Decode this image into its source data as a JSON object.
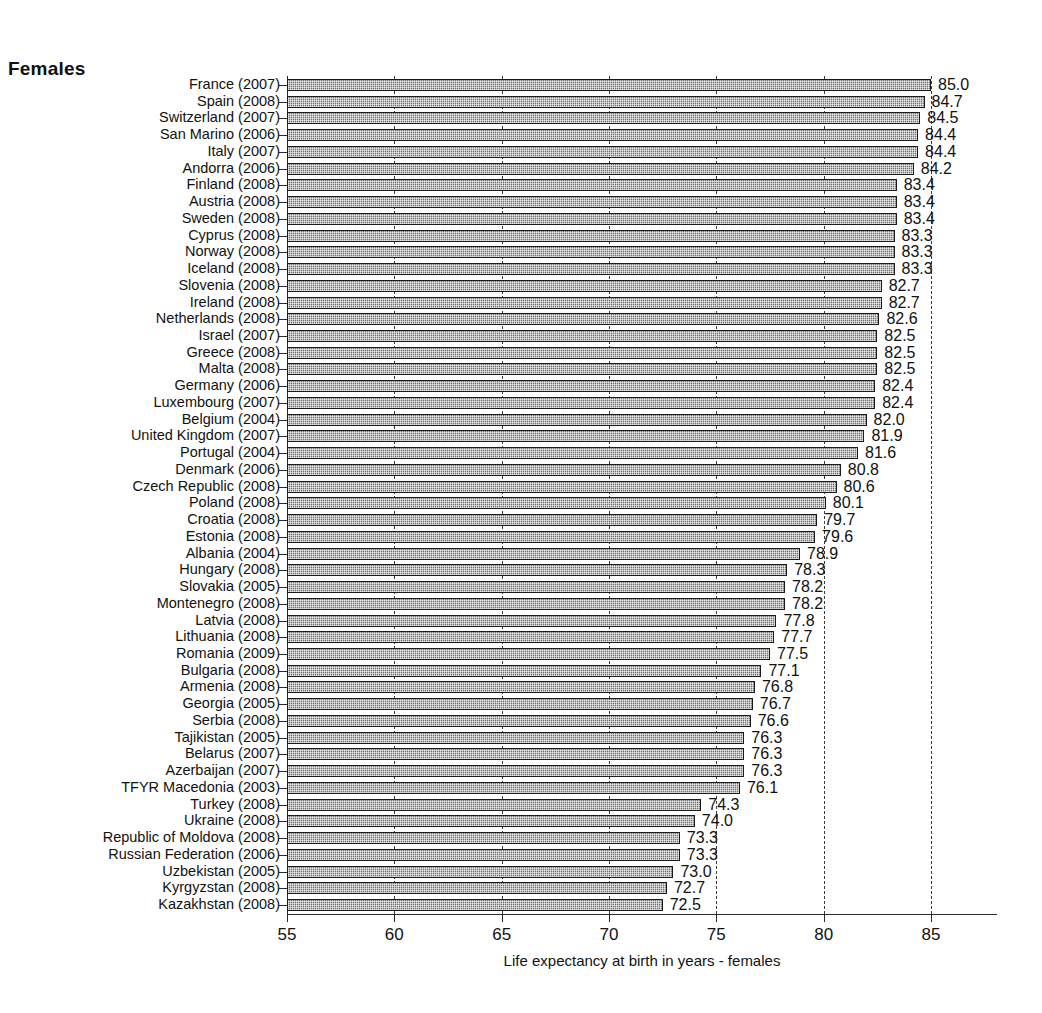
{
  "panel": {
    "title": "Females"
  },
  "chart_data": {
    "type": "bar",
    "orientation": "horizontal",
    "title": "Females",
    "xlabel": "Life expectancy at birth in years - females",
    "ylabel": "",
    "xlim": [
      55,
      88.1
    ],
    "xticks": [
      55,
      60,
      65,
      70,
      75,
      80,
      85
    ],
    "xtick_labels": [
      "55",
      "60",
      "65",
      "70",
      "75",
      "80",
      "85"
    ],
    "grid": "vertical-dashed",
    "gridlines": [
      60,
      65,
      70,
      75,
      80,
      85
    ],
    "legend": "none",
    "bar_fill": "#8b8b8b",
    "bar_edge": "#1a1a1a",
    "value_label_format": "one-decimal",
    "categories": [
      "France (2007)",
      "Spain (2008)",
      "Switzerland (2007)",
      "San Marino (2006)",
      "Italy (2007)",
      "Andorra (2006)",
      "Finland (2008)",
      "Austria (2008)",
      "Sweden (2008)",
      "Cyprus (2008)",
      "Norway (2008)",
      "Iceland (2008)",
      "Slovenia (2008)",
      "Ireland (2008)",
      "Netherlands (2008)",
      "Israel (2007)",
      "Greece (2008)",
      "Malta (2008)",
      "Germany (2006)",
      "Luxembourg (2007)",
      "Belgium (2004)",
      "United Kingdom (2007)",
      "Portugal (2004)",
      "Denmark (2006)",
      "Czech Republic (2008)",
      "Poland (2008)",
      "Croatia (2008)",
      "Estonia (2008)",
      "Albania (2004)",
      "Hungary (2008)",
      "Slovakia (2005)",
      "Montenegro (2008)",
      "Latvia (2008)",
      "Lithuania (2008)",
      "Romania (2009)",
      "Bulgaria (2008)",
      "Armenia (2008)",
      "Georgia (2005)",
      "Serbia (2008)",
      "Tajikistan (2005)",
      "Belarus (2007)",
      "Azerbaijan (2007)",
      "TFYR Macedonia (2003)",
      "Turkey (2008)",
      "Ukraine (2008)",
      "Republic of Moldova (2008)",
      "Russian Federation (2006)",
      "Uzbekistan (2005)",
      "Kyrgyzstan (2008)",
      "Kazakhstan (2008)"
    ],
    "values": [
      85.0,
      84.7,
      84.5,
      84.4,
      84.4,
      84.2,
      83.4,
      83.4,
      83.4,
      83.3,
      83.3,
      83.3,
      82.7,
      82.7,
      82.6,
      82.5,
      82.5,
      82.5,
      82.4,
      82.4,
      82.0,
      81.9,
      81.6,
      80.8,
      80.6,
      80.1,
      79.7,
      79.6,
      78.9,
      78.3,
      78.2,
      78.2,
      77.8,
      77.7,
      77.5,
      77.1,
      76.8,
      76.7,
      76.6,
      76.3,
      76.3,
      76.3,
      76.1,
      74.3,
      74.0,
      73.3,
      73.3,
      73.0,
      72.7,
      72.5
    ],
    "value_labels": [
      "85.0",
      "84.7",
      "84.5",
      "84.4",
      "84.4",
      "84.2",
      "83.4",
      "83.4",
      "83.4",
      "83.3",
      "83.3",
      "83.3",
      "82.7",
      "82.7",
      "82.6",
      "82.5",
      "82.5",
      "82.5",
      "82.4",
      "82.4",
      "82.0",
      "81.9",
      "81.6",
      "80.8",
      "80.6",
      "80.1",
      "79.7",
      "79.6",
      "78.9",
      "78.3",
      "78.2",
      "78.2",
      "77.8",
      "77.7",
      "77.5",
      "77.1",
      "76.8",
      "76.7",
      "76.6",
      "76.3",
      "76.3",
      "76.3",
      "76.1",
      "74.3",
      "74.0",
      "73.3",
      "73.3",
      "73.0",
      "72.7",
      "72.5"
    ]
  }
}
